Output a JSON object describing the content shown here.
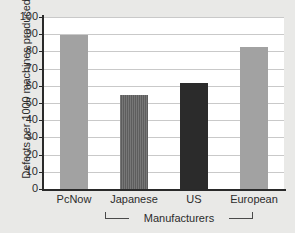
{
  "chart_data": {
    "type": "bar",
    "title": "",
    "xlabel": "Manufacturers",
    "ylabel": "Defects per 1000 machines produced",
    "categories": [
      "PcNow",
      "Japanese",
      "US",
      "European"
    ],
    "values": [
      89.5,
      54.5,
      61.5,
      82.5
    ],
    "series": [
      {
        "name": "Defects per 1000 machines produced",
        "values": [
          89.5,
          54.5,
          61.5,
          82.5
        ]
      }
    ],
    "ylim": [
      0,
      100
    ],
    "ytick_labels": [
      "0",
      "10",
      "20",
      "30",
      "40",
      "50",
      "60",
      "70",
      "80",
      "90",
      "100"
    ],
    "ytick_values": [
      0,
      10,
      20,
      30,
      40,
      50,
      60,
      70,
      80,
      90,
      100
    ],
    "grid": true,
    "legend": "none",
    "legend_position": "none",
    "bar_colors": [
      "#a2a2a2",
      "#5d5d5d",
      "#2b2b2b",
      "#a2a2a2"
    ],
    "group_bracket": {
      "label": "Manufacturers",
      "spans": [
        "Japanese",
        "US",
        "European"
      ]
    },
    "annotations": []
  },
  "figure": {
    "background_color": "#e9e9e7",
    "plot_background_color": "#ffffff",
    "axis_color": "#2a2a2a",
    "gridline_color": "#c9c9c9",
    "text_color": "#2c2c2c"
  }
}
